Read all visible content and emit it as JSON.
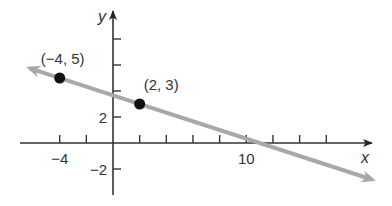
{
  "chart_data": {
    "type": "line",
    "title": "",
    "xlabel": "x",
    "ylabel": "y",
    "x_ticks": [
      -4,
      -2,
      0,
      2,
      4,
      6,
      8,
      10,
      12,
      14,
      16
    ],
    "x_tick_labels": [
      {
        "value": -4,
        "label": "−4"
      },
      {
        "value": 10,
        "label": "10"
      }
    ],
    "y_ticks": [
      -2,
      2,
      4,
      6,
      8
    ],
    "y_tick_labels": [
      {
        "value": 2,
        "label": "2"
      },
      {
        "value": -2,
        "label": "−2"
      }
    ],
    "xlim": [
      -7,
      19
    ],
    "ylim": [
      -4,
      10
    ],
    "grid": false,
    "series": [
      {
        "name": "line through (-4,5) and (2,3)",
        "slope": -0.3333,
        "intercept": 3.6667,
        "x": [
          -7,
          20
        ],
        "y": [
          6,
          -3
        ],
        "color": "#a8a8a8"
      }
    ],
    "points": [
      {
        "x": -4,
        "y": 5,
        "label": "(−4, 5)"
      },
      {
        "x": 2,
        "y": 3,
        "label": "(2, 3)"
      }
    ]
  },
  "colors": {
    "axis": "#333333",
    "line": "#a8a8a8",
    "point": "#111111"
  }
}
